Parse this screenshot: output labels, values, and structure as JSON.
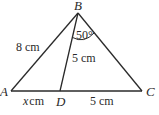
{
  "diagram": {
    "type": "triangle",
    "colors": {
      "line": "#2a2a2a",
      "background": "#ffffff"
    },
    "points": {
      "A": {
        "label": "A"
      },
      "B": {
        "label": "B"
      },
      "C": {
        "label": "C"
      },
      "D": {
        "label": "D"
      }
    },
    "segments": {
      "AB": {
        "label": "8 cm",
        "number": "8",
        "unit": "cm"
      },
      "BD": {
        "label": "5 cm",
        "number": "5",
        "unit": "cm"
      },
      "AD": {
        "label": "x cm",
        "variable": "x",
        "unit": "cm"
      },
      "DC": {
        "label": "5 cm",
        "number": "5",
        "unit": "cm"
      }
    },
    "angles": {
      "DBC": {
        "label": "50°"
      }
    }
  }
}
